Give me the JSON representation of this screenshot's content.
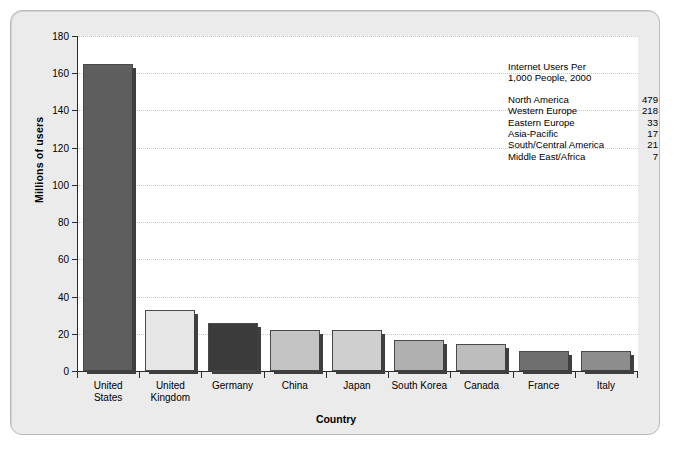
{
  "chart_data": {
    "type": "bar",
    "title": "",
    "xlabel": "Country",
    "ylabel": "Millions of users",
    "ylim": [
      0,
      180
    ],
    "ytick_step": 20,
    "yticks": [
      0,
      20,
      40,
      60,
      80,
      100,
      120,
      140,
      160,
      180
    ],
    "grid": true,
    "legend_position": "inside-top-right",
    "categories": [
      "United States",
      "United Kingdom",
      "Germany",
      "China",
      "Japan",
      "South Korea",
      "Canada",
      "France",
      "Italy"
    ],
    "category_lines": [
      [
        "United",
        "States"
      ],
      [
        "United",
        "Kingdom"
      ],
      [
        "Germany"
      ],
      [
        "China"
      ],
      [
        "Japan"
      ],
      [
        "South Korea"
      ],
      [
        "Canada"
      ],
      [
        "France"
      ],
      [
        "Italy"
      ]
    ],
    "values": [
      165,
      33,
      26,
      22,
      22,
      16.5,
      14.5,
      11,
      11
    ],
    "bar_colors": [
      "#5e5e5e",
      "#e6e6e6",
      "#3b3b3b",
      "#c4c4c4",
      "#cfcfcf",
      "#b0b0b0",
      "#bdbdbd",
      "#6f6f6f",
      "#8d8d8d"
    ],
    "annotation": {
      "title_lines": [
        "Internet Users Per",
        "1,000 People, 2000"
      ],
      "rows": [
        {
          "label": "North America",
          "value": "479"
        },
        {
          "label": "Western Europe",
          "value": "218"
        },
        {
          "label": "Eastern Europe",
          "value": "33"
        },
        {
          "label": "Asia-Pacific",
          "value": "17"
        },
        {
          "label": "South/Central America",
          "value": "21"
        },
        {
          "label": "Middle East/Africa",
          "value": "7"
        }
      ]
    }
  },
  "style": {
    "panel_background": "#ebebeb",
    "plot_background": "#ffffff",
    "axis_color": "#2b2b2b",
    "gridline_color": "#c9c9c9",
    "text_color": "#000000"
  }
}
